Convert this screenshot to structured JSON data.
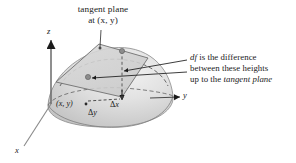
{
  "figure": {
    "title_line1": "tangent plane",
    "title_line2": "at (x, y)",
    "annotation_line1_prefix": "df",
    "annotation_line1_rest": " is the difference",
    "annotation_line2": "between these heights",
    "annotation_line3_prefix": "up to the ",
    "annotation_line3_italic": "tangent plane",
    "axis_x": "x",
    "axis_y": "y",
    "axis_z": "z",
    "point_label": "(x, y)",
    "delta_x_symbol": "Δ",
    "delta_x_var": "x",
    "delta_y_symbol": "Δ",
    "delta_y_var": "y",
    "colors": {
      "ink": "#1a1a1a",
      "surface_light": "#e9e9e9",
      "surface_mid": "#d2d2d2",
      "surface_dark": "#bdbdbd",
      "plane_fill": "#cfcfcf",
      "outline": "#6b6b6b",
      "dashed": "#4a4a4a",
      "dot": "#7a7a7a",
      "background": "#ffffff"
    }
  }
}
